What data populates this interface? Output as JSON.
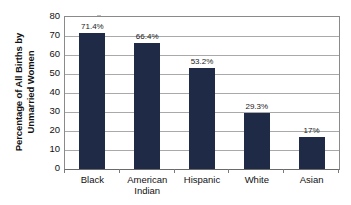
{
  "chart_data": {
    "type": "bar",
    "title": "",
    "subtitle": "",
    "xlabel": "",
    "ylabel": "Percentage of All Births by Unmarried Women",
    "ylabel_lines": [
      "Percentage of All Births by",
      "Unmarried Women"
    ],
    "categories": [
      "Black",
      "American Indian",
      "Hispanic",
      "White",
      "Asian"
    ],
    "category_label_lines": [
      [
        "Black"
      ],
      [
        "American",
        "Indian"
      ],
      [
        "Hispanic"
      ],
      [
        "White"
      ],
      [
        "Asian"
      ]
    ],
    "values": [
      71.4,
      66.4,
      53.2,
      29.3,
      17
    ],
    "data_labels": [
      "71.4%",
      "66.4%",
      "53.2%",
      "29.3%",
      "17%"
    ],
    "ylim": [
      0,
      80
    ],
    "y_tick_step": 10,
    "y_tick_labels": [
      "80",
      "70",
      "60",
      "50",
      "40",
      "30",
      "20",
      "10",
      "0"
    ],
    "y_tick_values": [
      80,
      70,
      60,
      50,
      40,
      30,
      20,
      10,
      0
    ],
    "grid": true,
    "grid_axis": "y",
    "legend": false,
    "legend_position": "none",
    "bar_color": "#1e2a46",
    "gridline_color": "#a9a9a9",
    "axis_color": "#8a8a8a",
    "background_color": "#ffffff",
    "text_color": "#111111"
  }
}
